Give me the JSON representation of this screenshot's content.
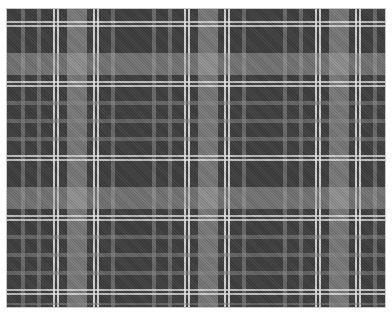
{
  "image": {
    "subject": "gray tartan plaid fabric pattern",
    "colors": {
      "base": "#3f3f3f",
      "mid_gray": "#8c8c8c",
      "light_gray": "#aaaaaa",
      "pinstripe": "#ebebeb",
      "border": "#c8c8c8",
      "background": "#ffffff"
    }
  }
}
